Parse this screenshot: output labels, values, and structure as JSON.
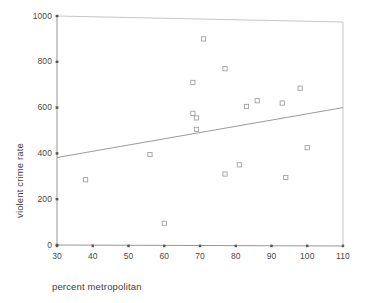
{
  "chart_data": {
    "type": "scatter",
    "title": "",
    "xlabel": "percent metropolitan",
    "ylabel": "violent crime rate",
    "xlim": [
      30,
      110
    ],
    "ylim": [
      0,
      1000
    ],
    "xticks": [
      30,
      40,
      50,
      60,
      70,
      80,
      90,
      100,
      110
    ],
    "yticks": [
      0,
      200,
      400,
      600,
      800,
      1000
    ],
    "grid": false,
    "legend": null,
    "marker": "open-square",
    "marker_color": "#9b9b9b",
    "axis_color": "#8a8a8a",
    "fit_line": {
      "type": "linear-regression",
      "color": "#8f8f8f",
      "x_start": 30,
      "y_start": 382,
      "x_end": 110,
      "y_end": 600
    },
    "points": [
      {
        "x": 38,
        "y": 285
      },
      {
        "x": 56,
        "y": 395
      },
      {
        "x": 60,
        "y": 95
      },
      {
        "x": 68,
        "y": 575
      },
      {
        "x": 68,
        "y": 710
      },
      {
        "x": 69,
        "y": 555
      },
      {
        "x": 69,
        "y": 505
      },
      {
        "x": 71,
        "y": 900
      },
      {
        "x": 77,
        "y": 770
      },
      {
        "x": 77,
        "y": 310
      },
      {
        "x": 81,
        "y": 350
      },
      {
        "x": 83,
        "y": 605
      },
      {
        "x": 86,
        "y": 630
      },
      {
        "x": 93,
        "y": 620
      },
      {
        "x": 94,
        "y": 295
      },
      {
        "x": 98,
        "y": 685
      },
      {
        "x": 100,
        "y": 425
      }
    ]
  },
  "labels": {
    "x_axis_title": "percent metropolitan",
    "y_axis_title": "violent crime rate",
    "ytick_1000": "1000",
    "ytick_800": "800",
    "ytick_600": "600",
    "ytick_400": "400",
    "ytick_200": "200",
    "ytick_0": "0",
    "xtick_30": "30",
    "xtick_40": "40",
    "xtick_50": "50",
    "xtick_60": "60",
    "xtick_70": "70",
    "xtick_80": "80",
    "xtick_90": "90",
    "xtick_100": "100",
    "xtick_110": "110"
  }
}
